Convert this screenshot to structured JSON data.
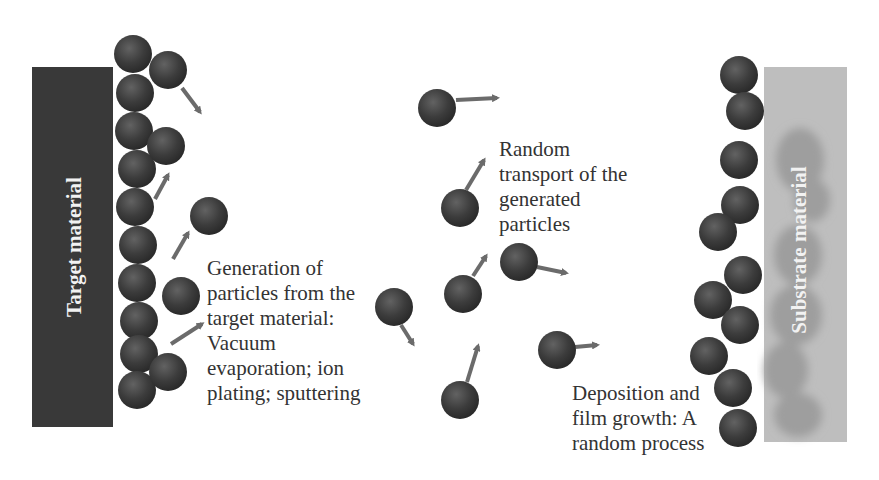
{
  "diagram": {
    "colors": {
      "target_bar": "#393939",
      "substrate_bar": "#bebebe",
      "substrate_blob": "#9e9e9e",
      "particle": "#3a3a3a",
      "particle_highlight": "#666666",
      "arrow": "#6b6b6b",
      "text": "#333333"
    },
    "target": {
      "label": "Target material",
      "x": 32,
      "y": 67,
      "w": 81,
      "h": 360
    },
    "substrate": {
      "label": "Substrate material",
      "x": 764,
      "y": 67,
      "w": 83,
      "h": 375
    },
    "labels": {
      "generation": "Generation of\nparticles from the\ntarget material:\nVacuum\nevaporation; ion\nplating; sputtering",
      "transport": "Random\ntransport of the\ngenerated\nparticles",
      "deposition": "Deposition and\nfilm growth: A\nrandom process"
    },
    "particles": [
      {
        "x": 133,
        "y": 54
      },
      {
        "x": 135,
        "y": 93
      },
      {
        "x": 134,
        "y": 131
      },
      {
        "x": 137,
        "y": 169
      },
      {
        "x": 135,
        "y": 207
      },
      {
        "x": 138,
        "y": 245
      },
      {
        "x": 137,
        "y": 283
      },
      {
        "x": 139,
        "y": 321
      },
      {
        "x": 139,
        "y": 354
      },
      {
        "x": 137,
        "y": 390
      },
      {
        "x": 168,
        "y": 70
      },
      {
        "x": 166,
        "y": 146
      },
      {
        "x": 209,
        "y": 216
      },
      {
        "x": 181,
        "y": 296
      },
      {
        "x": 168,
        "y": 372
      },
      {
        "x": 437,
        "y": 108
      },
      {
        "x": 460,
        "y": 208
      },
      {
        "x": 394,
        "y": 307
      },
      {
        "x": 463,
        "y": 294
      },
      {
        "x": 519,
        "y": 262
      },
      {
        "x": 557,
        "y": 350
      },
      {
        "x": 460,
        "y": 400
      },
      {
        "x": 739,
        "y": 75
      },
      {
        "x": 745,
        "y": 111
      },
      {
        "x": 739,
        "y": 160
      },
      {
        "x": 740,
        "y": 205
      },
      {
        "x": 718,
        "y": 232
      },
      {
        "x": 743,
        "y": 275
      },
      {
        "x": 713,
        "y": 300
      },
      {
        "x": 740,
        "y": 325
      },
      {
        "x": 709,
        "y": 356
      },
      {
        "x": 733,
        "y": 388
      },
      {
        "x": 738,
        "y": 428
      }
    ],
    "arrows": [
      {
        "x1": 182,
        "y1": 88,
        "x2": 200,
        "y2": 112
      },
      {
        "x1": 155,
        "y1": 199,
        "x2": 168,
        "y2": 175
      },
      {
        "x1": 173,
        "y1": 259,
        "x2": 188,
        "y2": 233
      },
      {
        "x1": 171,
        "y1": 344,
        "x2": 202,
        "y2": 324
      },
      {
        "x1": 456,
        "y1": 100,
        "x2": 497,
        "y2": 98
      },
      {
        "x1": 466,
        "y1": 190,
        "x2": 484,
        "y2": 160
      },
      {
        "x1": 401,
        "y1": 325,
        "x2": 413,
        "y2": 344
      },
      {
        "x1": 473,
        "y1": 276,
        "x2": 486,
        "y2": 256
      },
      {
        "x1": 537,
        "y1": 267,
        "x2": 566,
        "y2": 273
      },
      {
        "x1": 575,
        "y1": 347,
        "x2": 597,
        "y2": 345
      },
      {
        "x1": 467,
        "y1": 382,
        "x2": 478,
        "y2": 346
      }
    ]
  }
}
